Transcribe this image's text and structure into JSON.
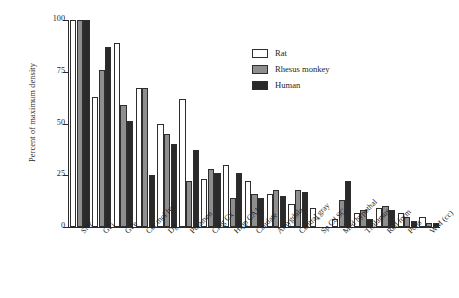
{
  "chart_data": {
    "type": "bar",
    "title": "",
    "xlabel": "",
    "ylabel": "Percent of maximum density",
    "ylim": [
      0,
      100
    ],
    "yticks": [
      0,
      25,
      50,
      75,
      100
    ],
    "grid": false,
    "legend_position": "upper-right",
    "annotations": [
      {
        "category": "Sp Cd SG",
        "series": [
          "Rhesus monkey",
          "Human"
        ],
        "marker": "*",
        "meaning": "no data"
      }
    ],
    "categories": [
      "SNr",
      "GPi",
      "GPe",
      "Cer mol lyr",
      "Dg",
      "Putamen",
      "Cing Cx",
      "Hipp CA1",
      "Caudate",
      "Amygdala",
      "Central gray",
      "Sp Cd SG",
      "Med hypothal",
      "Thalamus",
      "Red form",
      "Pons",
      "WM (cc)"
    ],
    "series": [
      {
        "name": "Rat",
        "color": "#ffffff",
        "values": [
          100,
          63,
          89,
          67,
          50,
          62,
          23,
          30,
          22,
          16,
          11,
          9,
          4,
          7,
          9,
          7,
          5
        ]
      },
      {
        "name": "Rhesus monkey",
        "color": "#8e8e8e",
        "values": [
          100,
          76,
          59,
          67,
          45,
          22,
          28,
          14,
          16,
          18,
          18,
          null,
          13,
          8,
          10,
          5,
          2
        ]
      },
      {
        "name": "Human",
        "color": "#2a2a2a",
        "values": [
          100,
          87,
          51,
          25,
          40,
          37,
          26,
          26,
          14,
          15,
          17,
          null,
          22,
          4,
          8,
          3,
          2
        ]
      }
    ]
  },
  "legend": {
    "items": [
      {
        "label": "Rat",
        "key": "rat"
      },
      {
        "label": "Rhesus monkey",
        "key": "monkey"
      },
      {
        "label": "Human",
        "key": "human"
      }
    ]
  }
}
